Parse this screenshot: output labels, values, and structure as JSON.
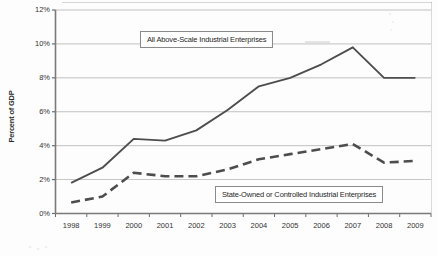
{
  "chart_data": {
    "type": "line",
    "title": "",
    "subtitle": "",
    "xlabel": "",
    "ylabel": "Percent of GDP",
    "categories": [
      "1998",
      "1999",
      "2000",
      "2001",
      "2002",
      "2003",
      "2004",
      "2005",
      "2006",
      "2007",
      "2008",
      "2009"
    ],
    "ylim": [
      0,
      12
    ],
    "ytick_values": [
      0,
      2,
      4,
      6,
      8,
      10,
      12
    ],
    "ytick_labels": [
      "0%",
      "2%",
      "4%",
      "6%",
      "8%",
      "10%",
      "12%"
    ],
    "grid": true,
    "legend_position": "inline-callout-boxes",
    "series": [
      {
        "name": "All Above-Scale Industrial Enterprises",
        "style": "solid",
        "color": "#4d4d4d",
        "values": [
          1.8,
          2.7,
          4.4,
          4.3,
          4.9,
          6.1,
          7.5,
          8.0,
          8.8,
          9.8,
          8.0,
          8.0
        ]
      },
      {
        "name": "State-Owned or Controlled Industrial Enterprises",
        "style": "dashed",
        "color": "#4d4d4d",
        "values": [
          0.65,
          1.0,
          2.4,
          2.2,
          2.2,
          2.6,
          3.2,
          3.5,
          3.8,
          4.1,
          3.0,
          3.1
        ]
      }
    ],
    "annotations": [
      {
        "text": "All Above-Scale Industrial Enterprises",
        "series": 0
      },
      {
        "text": "State-Owned or Controlled Industrial Enterprises",
        "series": 1
      }
    ]
  },
  "colors": {
    "line": "#4d4d4d",
    "grid": "#9a9a9a",
    "axis": "#6b6b6b",
    "text": "#333333",
    "callout_border": "#8a8a8a",
    "background": "#fdfdfd"
  }
}
